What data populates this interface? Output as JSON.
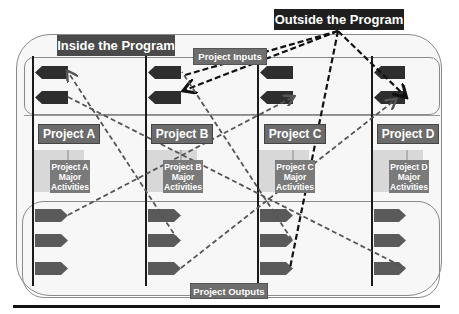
{
  "diagram": {
    "inside_title": "Inside the Program",
    "outside_title": "Outside the Program",
    "inputs_label": "Project Inputs",
    "outputs_label": "Project Outputs",
    "projects": [
      {
        "name": "Project A",
        "activities": [
          "Project A",
          "Major",
          "Activities"
        ],
        "x": 34
      },
      {
        "name": "Project B",
        "activities": [
          "Project B",
          "Major",
          "Activities"
        ],
        "x": 146
      },
      {
        "name": "Project C",
        "activities": [
          "Project C",
          "Major",
          "Activities"
        ],
        "x": 258
      },
      {
        "name": "Project D",
        "activities": [
          "Project D",
          "Major",
          "Activities"
        ],
        "x": 373
      }
    ],
    "colors": {
      "dark_label": "#3f3f3f",
      "project_box": "#6b6b6b",
      "arrow_shape": "#2e2e2e",
      "output_shape": "#5a5a5a",
      "dashed_dark": "#111111",
      "dashed_gray": "#555555"
    }
  }
}
